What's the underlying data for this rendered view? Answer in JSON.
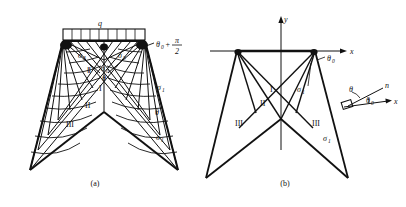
{
  "figure": {
    "panels": [
      {
        "caption": "(a)",
        "load_label": "q",
        "labels": {
          "sigma_left": "σ",
          "sigma_left_sub": "3",
          "sigma_mid": "σ",
          "sigma_mid_sub": "3",
          "sigma_center_small": "σ",
          "sigma_center_small_sub": "0",
          "theta_small": "θ",
          "sigma_right_upper": "σ",
          "sigma_right_upper_sub": "1",
          "sigma_right_lower": "σ",
          "sigma_right_lower_sub": "1",
          "theta_expr_base": "θ",
          "theta_expr_sub": "0",
          "theta_expr_plus": "+",
          "theta_expr_num": "π",
          "theta_expr_den": "2",
          "theta_right": "θ",
          "zone_I": "I",
          "zone_II": "II",
          "zone_III": "III",
          "zone_II_upper": "Ⅱ"
        }
      },
      {
        "caption": "(b)",
        "labels": {
          "axis_y": "y",
          "axis_x": "x",
          "axis_x_detail": "x",
          "normal_n": "n",
          "theta": "θ",
          "theta0_upper_base": "θ",
          "theta0_upper_sub": "0",
          "theta0_detail_base": "θ",
          "theta0_detail_sub": "0",
          "sigma_upper": "σ",
          "sigma_upper_sub": "1",
          "sigma_lower": "σ",
          "sigma_lower_sub": "1",
          "zone_I": "I",
          "zone_II": "II",
          "zone_III_left": "III",
          "zone_III_right": "III"
        }
      }
    ],
    "colors": {
      "line": "#111111",
      "background": "#ffffff"
    }
  }
}
